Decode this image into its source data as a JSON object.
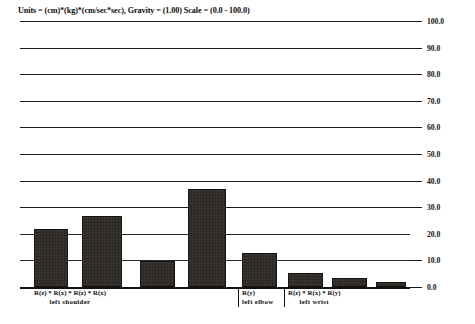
{
  "title": "Units = (cm)*(kg)*(cm/sec*sec), Gravity = (1.00) Scale = (0.0 - 100.0)",
  "axis": {
    "y_ticks": [
      "100.0",
      "90.0",
      "80.0",
      "70.0",
      "60.0",
      "50.0",
      "40.0",
      "30.0",
      "20.0",
      "10.0",
      "0.0"
    ]
  },
  "groups": [
    {
      "rotations": "R(z) * R(x) * R(z) * R(x)",
      "joint": "left shoulder"
    },
    {
      "rotations": "R(y)",
      "joint": "left elbow"
    },
    {
      "rotations": "R(z) * R(x) * R(y)",
      "joint": "left wrist"
    }
  ],
  "chart_data": {
    "type": "bar",
    "title": "Units = (cm)*(kg)*(cm/sec*sec), Gravity = (1.00) Scale = (0.0 - 100.0)",
    "xlabel": "",
    "ylabel": "",
    "ylim": [
      0.0,
      100.0
    ],
    "ytick_step": 10.0,
    "grid": true,
    "legend": "none",
    "yaxis_side": "right",
    "categories": [
      "R(z) [left shoulder]",
      "R(x) [left shoulder]",
      "R(z) [left shoulder]",
      "R(x) [left shoulder]",
      "R(y) [left elbow]",
      "R(z) [left wrist]",
      "R(x) [left wrist]",
      "R(y) [left wrist]"
    ],
    "values": [
      21.0,
      26.0,
      9.0,
      36.0,
      12.0,
      4.5,
      2.5,
      1.0
    ],
    "groups": [
      {
        "label": "left shoulder",
        "rotations": "R(z) * R(x) * R(z) * R(x)",
        "bar_indices": [
          0,
          1,
          2,
          3
        ]
      },
      {
        "label": "left elbow",
        "rotations": "R(y)",
        "bar_indices": [
          4
        ]
      },
      {
        "label": "left wrist",
        "rotations": "R(z) * R(x) * R(y)",
        "bar_indices": [
          5,
          6,
          7
        ]
      }
    ]
  },
  "colors": {
    "bar": "#2b2724",
    "axis": "#111111",
    "background": "#ffffff"
  }
}
